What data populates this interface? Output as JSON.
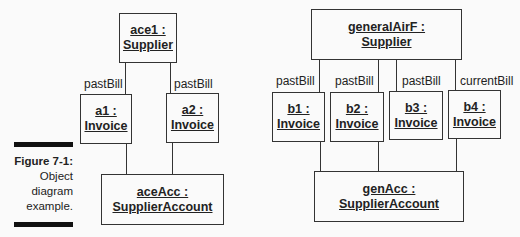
{
  "figure": {
    "label": "Figure 7-1:",
    "caption_lines": [
      "Object",
      "diagram",
      "example."
    ]
  },
  "left_diagram": {
    "root": {
      "line1": "ace1 :",
      "line2": "Supplier"
    },
    "invoices": [
      {
        "role": "pastBill",
        "line1": "a1 :",
        "line2": "Invoice"
      },
      {
        "role": "pastBill",
        "line1": "a2 :",
        "line2": "Invoice"
      }
    ],
    "account": {
      "line1": "aceAcc :",
      "line2": "SupplierAccount"
    }
  },
  "right_diagram": {
    "root": {
      "line1": "generalAirF :",
      "line2": "Supplier"
    },
    "invoices": [
      {
        "role": "pastBill",
        "line1": "b1 :",
        "line2": "Invoice"
      },
      {
        "role": "pastBill",
        "line1": "b2 :",
        "line2": "Invoice"
      },
      {
        "role": "pastBill",
        "line1": "b3 :",
        "line2": "Invoice"
      },
      {
        "role": "currentBill",
        "line1": "b4 :",
        "line2": "Invoice"
      }
    ],
    "account": {
      "line1": "genAcc :",
      "line2": "SupplierAccount"
    }
  }
}
